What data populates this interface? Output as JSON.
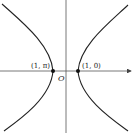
{
  "diagram": {
    "type": "polar hyperbola",
    "origin_label": "O",
    "points": [
      {
        "label": "(1, π)",
        "x": 53,
        "y": 71
      },
      {
        "label": "(1, 0)",
        "x": 78,
        "y": 71
      }
    ],
    "colors": {
      "curve": "#222222",
      "axis": "#444444",
      "background": "#ffffff"
    }
  }
}
